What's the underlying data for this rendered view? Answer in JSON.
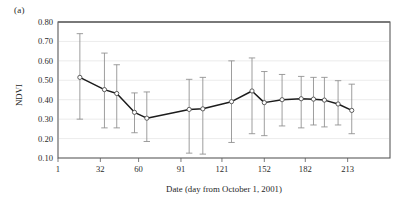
{
  "figure": {
    "panel_label": "(a)",
    "background_color": "#ffffff"
  },
  "chart_data": {
    "type": "line",
    "title": "",
    "subtitle": "",
    "xlabel": "Date (day from October 1, 2001)",
    "ylabel": "NDVI",
    "xlim": [
      1,
      244
    ],
    "ylim": [
      0.1,
      0.8
    ],
    "xticks": [
      1,
      32,
      60,
      91,
      121,
      152,
      182,
      213
    ],
    "xtick_labels": [
      "1",
      "32",
      "60",
      "91",
      "121",
      "152",
      "182",
      "213"
    ],
    "yticks": [
      0.1,
      0.2,
      0.3,
      0.4,
      0.5,
      0.6,
      0.7,
      0.8
    ],
    "ytick_labels": [
      "0.10",
      "0.20",
      "0.30",
      "0.40",
      "0.50",
      "0.60",
      "0.70",
      "0.80"
    ],
    "grid": "horizontal",
    "legend": "none",
    "marker": "open-circle",
    "error_bars": "vertical-capped",
    "line_color": "#1c1c1c",
    "error_color": "#8c8c8c",
    "marker_fill": "#ffffff",
    "series": [
      {
        "name": "NDVI",
        "x": [
          17,
          35,
          44,
          57,
          66,
          97,
          107,
          128,
          143,
          152,
          165,
          179,
          188,
          196,
          206,
          216
        ],
        "values": [
          0.515,
          0.452,
          0.432,
          0.335,
          0.305,
          0.35,
          0.353,
          0.39,
          0.445,
          0.385,
          0.4,
          0.405,
          0.403,
          0.398,
          0.378,
          0.345
        ],
        "err_low": [
          0.3,
          0.255,
          0.255,
          0.23,
          0.185,
          0.125,
          0.12,
          0.18,
          0.225,
          0.215,
          0.265,
          0.255,
          0.27,
          0.26,
          0.27,
          0.225
        ],
        "err_high": [
          0.74,
          0.64,
          0.58,
          0.435,
          0.44,
          0.505,
          0.515,
          0.6,
          0.615,
          0.545,
          0.53,
          0.52,
          0.515,
          0.515,
          0.498,
          0.48
        ]
      }
    ]
  }
}
